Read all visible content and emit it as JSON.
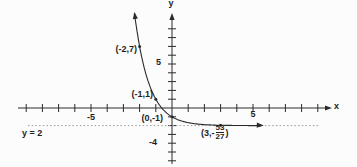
{
  "colors": {
    "ink": "#2a2a2a",
    "asymptote_line": "#9a9a9a",
    "background": "#fcfcfc"
  },
  "chart_data": {
    "type": "line",
    "title": "",
    "function": "y = 3^(-x) - 2",
    "axis": {
      "x_label": "x",
      "y_label": "y",
      "x_range": [
        -9,
        9
      ],
      "y_range": [
        -6,
        9
      ],
      "x_tick_step": 1,
      "y_tick_step": 1,
      "x_tick_labels": [
        {
          "value": -5,
          "text": "-5"
        },
        {
          "value": 5,
          "text": "5"
        }
      ],
      "y_tick_labels": [
        {
          "value": 5,
          "text": "5"
        },
        {
          "value": -4,
          "text": "-4"
        }
      ],
      "grid": false
    },
    "points": [
      {
        "x": -2,
        "y": 7,
        "label": "(-2,7)"
      },
      {
        "x": -1,
        "y": 1,
        "label": "(-1,1)"
      },
      {
        "x": 0,
        "y": -1,
        "label": "(0,-1)"
      },
      {
        "x": 3,
        "y": -1.963,
        "label_prefix": "(3,-",
        "label_numerator": "53",
        "label_denominator": "27",
        "label_suffix": ")"
      }
    ],
    "asymptote": {
      "y": -2,
      "label": "y = 2"
    },
    "curve_x_range": [
      -2.32,
      5.5
    ],
    "curve_base": 3
  }
}
